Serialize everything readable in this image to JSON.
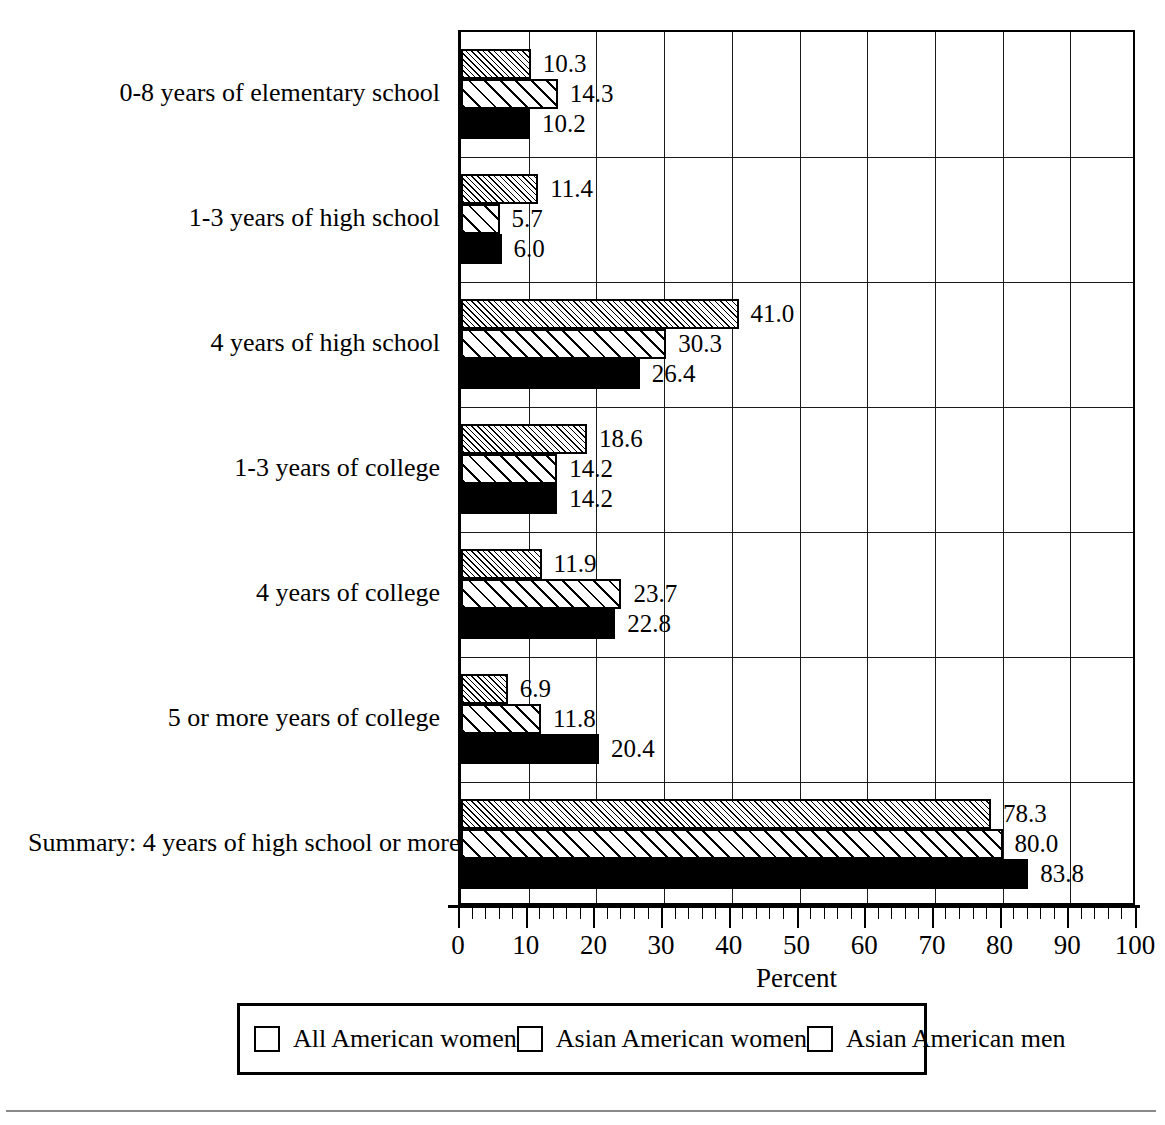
{
  "chart_data": {
    "type": "bar",
    "orientation": "horizontal",
    "title": "",
    "xlabel": "Percent",
    "ylabel": "",
    "xlim": [
      0,
      100
    ],
    "xticks": [
      0,
      10,
      20,
      30,
      40,
      50,
      60,
      70,
      80,
      90,
      100
    ],
    "xtick_labels": [
      "0",
      "10",
      "20",
      "30",
      "40",
      "50",
      "60",
      "70",
      "80",
      "90",
      "100"
    ],
    "minor_tick_step": 2,
    "grid": "vertical gridlines at every major tick; horizontal gridlines separating category groups",
    "legend_position": "bottom, inside boxed panel",
    "categories": [
      "0-8 years of elementary school",
      "1-3 years of high school",
      "4 years of high school",
      "1-3 years of college",
      "4 years of college",
      "5 or more years of college",
      "Summary: 4 years of high school or more"
    ],
    "series": [
      {
        "name": "All American women",
        "pattern": "dense-diagonal-hatch",
        "values": [
          10.3,
          11.4,
          41.0,
          18.6,
          11.9,
          6.9,
          78.3
        ],
        "labels": [
          "10.3",
          "11.4",
          "41.0",
          "18.6",
          "11.9",
          "6.9",
          "78.3"
        ]
      },
      {
        "name": "Asian American women",
        "pattern": "wide-diagonal-hatch",
        "values": [
          14.3,
          5.7,
          30.3,
          14.2,
          23.7,
          11.8,
          80.0
        ],
        "labels": [
          "14.3",
          "5.7",
          "30.3",
          "14.2",
          "23.7",
          "11.8",
          "80.0"
        ]
      },
      {
        "name": "Asian American men",
        "pattern": "solid-black",
        "values": [
          10.2,
          6.0,
          26.4,
          14.2,
          22.8,
          20.4,
          83.8
        ],
        "labels": [
          "10.2",
          "6.0",
          "26.4",
          "14.2",
          "22.8",
          "20.4",
          "83.8"
        ]
      }
    ]
  },
  "legend": {
    "entries": [
      {
        "label": "All American women",
        "pattern": "dense-diagonal-hatch"
      },
      {
        "label": "Asian American women",
        "pattern": "wide-diagonal-hatch"
      },
      {
        "label": "Asian American men",
        "pattern": "solid-black"
      }
    ]
  },
  "colors": {
    "ink": "#000000",
    "background": "#ffffff",
    "gridline": "#1a1a1a",
    "footer_rule": "#8a8a8a"
  }
}
